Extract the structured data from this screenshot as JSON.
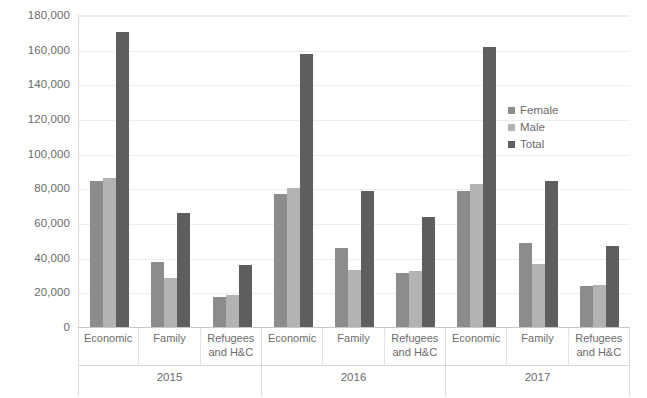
{
  "chart_data": {
    "type": "bar",
    "title": "",
    "xlabel": "",
    "ylabel": "",
    "ylim": [
      0,
      180000
    ],
    "grid": true,
    "legend_position": "inside-right",
    "y_ticks": [
      "0",
      "20,000",
      "40,000",
      "60,000",
      "80,000",
      "100,000",
      "120,000",
      "140,000",
      "160,000",
      "180,000"
    ],
    "y_tick_values": [
      0,
      20000,
      40000,
      60000,
      80000,
      100000,
      120000,
      140000,
      160000,
      180000
    ],
    "legend": [
      "Female",
      "Male",
      "Total"
    ],
    "series": [
      {
        "name": "Female",
        "color": "#8c8c8c",
        "values": [
          84000,
          37500,
          17500,
          76500,
          45500,
          31000,
          78500,
          48500,
          23500
        ]
      },
      {
        "name": "Male",
        "color": "#b3b3b3",
        "values": [
          86000,
          28000,
          18500,
          80000,
          33000,
          32500,
          82500,
          36500,
          24500
        ]
      },
      {
        "name": "Total",
        "color": "#5e5e5e",
        "values": [
          170000,
          65500,
          36000,
          157500,
          78500,
          63500,
          161500,
          84500,
          47000
        ]
      }
    ],
    "categories": [
      "Economic",
      "Family",
      "Refugees and H&C",
      "Economic",
      "Family",
      "Refugees and H&C",
      "Economic",
      "Family",
      "Refugees and H&C"
    ],
    "groups": [
      {
        "year": "2015",
        "categories": [
          {
            "label_line1": "Economic",
            "label_line2": "",
            "Female": 84000,
            "Male": 86000,
            "Total": 170000
          },
          {
            "label_line1": "Family",
            "label_line2": "",
            "Female": 37500,
            "Male": 28000,
            "Total": 65500
          },
          {
            "label_line1": "Refugees",
            "label_line2": "and H&C",
            "Female": 17500,
            "Male": 18500,
            "Total": 36000
          }
        ]
      },
      {
        "year": "2016",
        "categories": [
          {
            "label_line1": "Economic",
            "label_line2": "",
            "Female": 76500,
            "Male": 80000,
            "Total": 157500
          },
          {
            "label_line1": "Family",
            "label_line2": "",
            "Female": 45500,
            "Male": 33000,
            "Total": 78500
          },
          {
            "label_line1": "Refugees",
            "label_line2": "and H&C",
            "Female": 31000,
            "Male": 32500,
            "Total": 63500
          }
        ]
      },
      {
        "year": "2017",
        "categories": [
          {
            "label_line1": "Economic",
            "label_line2": "",
            "Female": 78500,
            "Male": 82500,
            "Total": 161500
          },
          {
            "label_line1": "Family",
            "label_line2": "",
            "Female": 48500,
            "Male": 36500,
            "Total": 84500
          },
          {
            "label_line1": "Refugees",
            "label_line2": "and H&C",
            "Female": 23500,
            "Male": 24500,
            "Total": 47000
          }
        ]
      }
    ]
  },
  "legend": {
    "items": [
      {
        "label": "Female",
        "color": "#8c8c8c"
      },
      {
        "label": "Male",
        "color": "#b3b3b3"
      },
      {
        "label": "Total",
        "color": "#5e5e5e"
      }
    ]
  },
  "axis": {
    "y_labels": [
      "180,000",
      "160,000",
      "140,000",
      "120,000",
      "100,000",
      "80,000",
      "60,000",
      "40,000",
      "20,000",
      "0"
    ]
  }
}
